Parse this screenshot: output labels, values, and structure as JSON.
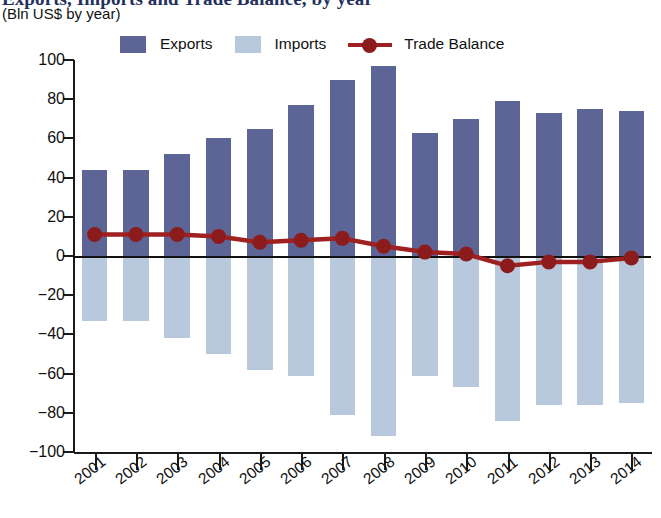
{
  "title": {
    "main": "Exports, Imports and Trade Balance, by year",
    "subtitle": "(Bln US$ by year)"
  },
  "legend": {
    "position": "top",
    "items": [
      {
        "label": "Exports",
        "color": "#5c6596",
        "marker": "square"
      },
      {
        "label": "Imports",
        "color": "#b8c8dd",
        "marker": "square"
      },
      {
        "label": "Trade Balance",
        "color": "#9e2020",
        "marker": "line-dot"
      }
    ]
  },
  "axes": {
    "y_ticks": [
      "100",
      "80",
      "60",
      "40",
      "20",
      "0",
      "−20",
      "−40",
      "−60",
      "−80",
      "−100"
    ],
    "y_tick_values": [
      100,
      80,
      60,
      40,
      20,
      0,
      -20,
      -40,
      -60,
      -80,
      -100
    ]
  },
  "colors": {
    "exports": "#5c6596",
    "imports": "#b8c8dd",
    "balance_line": "#9e2020",
    "balance_marker": "#8c1b1b",
    "axis": "#1a1a1a",
    "title": "#23305c"
  },
  "chart_data": {
    "type": "bar",
    "title": "Exports, Imports and Trade Balance, by year",
    "subtitle": "(Bln US$ by year)",
    "xlabel": "",
    "ylabel": "Bln US$",
    "ylim": [
      -100,
      100
    ],
    "ytick_step": 20,
    "grid": false,
    "legend_position": "top",
    "categories": [
      "2001",
      "2002",
      "2003",
      "2004",
      "2005",
      "2006",
      "2007",
      "2008",
      "2009",
      "2010",
      "2011",
      "2012",
      "2013",
      "2014"
    ],
    "series": [
      {
        "name": "Exports",
        "type": "bar",
        "color": "#5c6596",
        "values": [
          44,
          44,
          52,
          60,
          65,
          77,
          90,
          97,
          63,
          70,
          79,
          73,
          75,
          74
        ]
      },
      {
        "name": "Imports",
        "type": "bar",
        "color": "#b8c8dd",
        "values": [
          -33,
          -33,
          -42,
          -50,
          -58,
          -61,
          -81,
          -92,
          -61,
          -67,
          -84,
          -76,
          -76,
          -75
        ]
      },
      {
        "name": "Trade Balance",
        "type": "line",
        "color": "#9e2020",
        "values": [
          11,
          11,
          11,
          10,
          7,
          8,
          9,
          5,
          2,
          1,
          -5,
          -3,
          -3,
          -1
        ]
      }
    ]
  }
}
